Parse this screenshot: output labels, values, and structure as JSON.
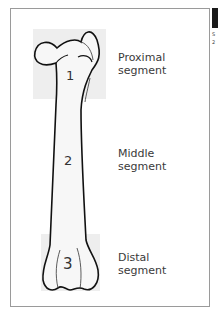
{
  "diagram": {
    "segments": [
      {
        "number": "1",
        "label_line1": "Proximal",
        "label_line2": "segment"
      },
      {
        "number": "2",
        "label_line1": "Middle",
        "label_line2": "segment"
      },
      {
        "number": "3",
        "label_line1": "Distal",
        "label_line2": "segment"
      }
    ],
    "colors": {
      "highlight_box": "#eeeeee",
      "outline": "#111111",
      "frame": "#9a9a9a",
      "text": "#3a3a3a"
    }
  },
  "clipped_side": {
    "line1": "S",
    "line2": "2"
  }
}
